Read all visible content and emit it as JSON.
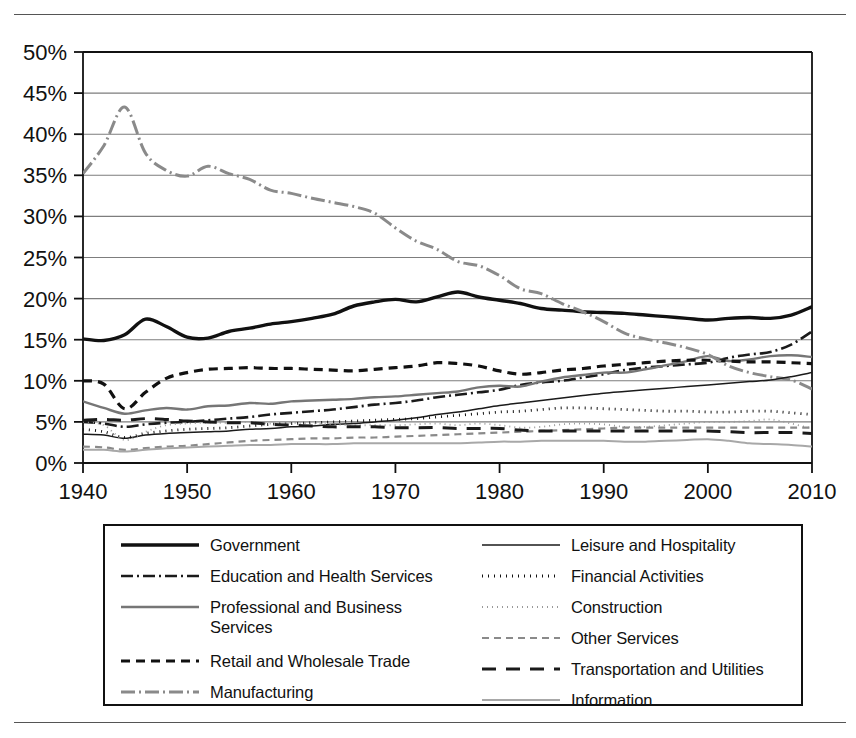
{
  "figure": {
    "kind": "line-chart",
    "has_top_rule": true,
    "has_bottom_rule": true
  },
  "chart_data": {
    "type": "line",
    "title": "",
    "subtitle": "",
    "xlabel": "",
    "ylabel": "",
    "xlim": [
      1940,
      2010
    ],
    "ylim": [
      0,
      50
    ],
    "grid": "horizontal",
    "legend_position": "below",
    "y_ticks": [
      "0%",
      "5%",
      "10%",
      "15%",
      "20%",
      "25%",
      "30%",
      "35%",
      "40%",
      "45%",
      "50%"
    ],
    "y_tick_values": [
      0,
      5,
      10,
      15,
      20,
      25,
      30,
      35,
      40,
      45,
      50
    ],
    "x_ticks": [
      "1940",
      "1950",
      "1960",
      "1970",
      "1980",
      "1990",
      "2000",
      "2010"
    ],
    "x_tick_values": [
      1940,
      1950,
      1960,
      1970,
      1980,
      1990,
      2000,
      2010
    ],
    "x": [
      1940,
      1942,
      1944,
      1946,
      1948,
      1950,
      1952,
      1954,
      1956,
      1958,
      1960,
      1962,
      1964,
      1966,
      1968,
      1970,
      1972,
      1974,
      1976,
      1978,
      1980,
      1982,
      1984,
      1986,
      1988,
      1990,
      1992,
      1994,
      1996,
      1998,
      2000,
      2002,
      2004,
      2006,
      2008,
      2010
    ],
    "series": [
      {
        "name": "Government",
        "style": "solid-thick",
        "color": "#111111",
        "width": 3.4,
        "dash": "",
        "values": [
          15.1,
          14.9,
          15.6,
          17.5,
          16.6,
          15.3,
          15.2,
          16.0,
          16.4,
          16.9,
          17.2,
          17.6,
          18.1,
          19.1,
          19.6,
          19.9,
          19.6,
          20.2,
          20.8,
          20.2,
          19.8,
          19.4,
          18.8,
          18.6,
          18.4,
          18.3,
          18.2,
          18.0,
          17.8,
          17.6,
          17.4,
          17.6,
          17.7,
          17.6,
          18.0,
          19.0
        ]
      },
      {
        "name": "Education and Health Services",
        "style": "dash-dot",
        "color": "#1a1a1a",
        "width": 2.6,
        "dash": "12,4,2,4",
        "values": [
          5.0,
          4.8,
          4.4,
          4.7,
          4.9,
          5.0,
          5.2,
          5.4,
          5.6,
          5.9,
          6.1,
          6.3,
          6.5,
          6.8,
          7.1,
          7.3,
          7.6,
          8.0,
          8.3,
          8.6,
          8.9,
          9.5,
          9.8,
          10.0,
          10.4,
          10.8,
          11.3,
          11.6,
          11.8,
          12.0,
          12.2,
          12.8,
          13.2,
          13.5,
          14.4,
          16.0
        ]
      },
      {
        "name": "Professional and Business\nServices",
        "style": "solid-gray",
        "color": "#767676",
        "width": 2.4,
        "dash": "",
        "values": [
          7.5,
          6.7,
          6.0,
          6.4,
          6.7,
          6.5,
          6.9,
          7.0,
          7.3,
          7.2,
          7.5,
          7.6,
          7.7,
          7.8,
          8.0,
          8.1,
          8.3,
          8.5,
          8.7,
          9.2,
          9.4,
          9.3,
          9.9,
          10.4,
          10.7,
          11.0,
          11.0,
          11.4,
          11.9,
          12.4,
          13.0,
          12.4,
          12.6,
          13.0,
          13.1,
          12.9
        ]
      },
      {
        "name": "Retail and Wholesale Trade",
        "style": "dashed-thick",
        "color": "#111111",
        "width": 3.2,
        "dash": "9,6",
        "values": [
          10.0,
          9.6,
          6.6,
          8.6,
          10.3,
          11.0,
          11.4,
          11.5,
          11.6,
          11.5,
          11.5,
          11.4,
          11.3,
          11.2,
          11.4,
          11.6,
          11.8,
          12.2,
          12.1,
          11.8,
          11.2,
          10.8,
          11.0,
          11.3,
          11.5,
          11.8,
          12.0,
          12.2,
          12.4,
          12.5,
          12.5,
          12.4,
          12.3,
          12.3,
          12.2,
          12.1
        ]
      },
      {
        "name": "Manufacturing",
        "style": "dash-dot-gray",
        "color": "#8a8a8a",
        "width": 3.0,
        "dash": "14,4,2,4",
        "values": [
          35.2,
          38.6,
          43.3,
          37.7,
          35.6,
          34.9,
          36.1,
          35.2,
          34.5,
          33.2,
          32.8,
          32.2,
          31.7,
          31.2,
          30.4,
          28.6,
          27.0,
          26.0,
          24.5,
          24.0,
          22.8,
          21.2,
          20.6,
          19.4,
          18.4,
          17.2,
          15.8,
          15.1,
          14.6,
          14.0,
          13.2,
          11.8,
          11.0,
          10.5,
          10.1,
          9.0
        ]
      },
      {
        "name": "Leisure and Hospitality",
        "style": "solid-thin",
        "color": "#1a1a1a",
        "width": 1.5,
        "dash": "",
        "values": [
          3.5,
          3.4,
          3.0,
          3.4,
          3.6,
          3.7,
          3.8,
          3.9,
          4.1,
          4.2,
          4.4,
          4.5,
          4.7,
          4.8,
          5.0,
          5.2,
          5.5,
          5.9,
          6.2,
          6.6,
          7.0,
          7.3,
          7.6,
          7.9,
          8.2,
          8.5,
          8.7,
          8.9,
          9.1,
          9.3,
          9.5,
          9.7,
          9.9,
          10.1,
          10.5,
          11.0
        ]
      },
      {
        "name": "Financial Activities",
        "style": "dotted-bold",
        "color": "#111111",
        "width": 2.8,
        "dash": "1,5",
        "values": [
          4.1,
          3.8,
          3.1,
          3.6,
          3.9,
          4.1,
          4.2,
          4.3,
          4.5,
          4.7,
          4.8,
          4.9,
          5.0,
          5.1,
          5.2,
          5.3,
          5.4,
          5.6,
          5.8,
          6.0,
          6.2,
          6.3,
          6.5,
          6.7,
          6.7,
          6.6,
          6.5,
          6.4,
          6.3,
          6.3,
          6.2,
          6.2,
          6.3,
          6.3,
          6.1,
          5.9
        ]
      },
      {
        "name": "Construction",
        "style": "dotted-fine",
        "color": "#9a9a9a",
        "width": 1.8,
        "dash": "1,4",
        "values": [
          5.0,
          4.6,
          2.8,
          3.8,
          4.6,
          4.8,
          4.9,
          4.9,
          5.0,
          4.8,
          4.9,
          4.8,
          4.7,
          4.6,
          4.6,
          4.6,
          4.7,
          4.8,
          4.6,
          4.8,
          4.6,
          4.3,
          4.4,
          4.7,
          4.8,
          4.7,
          4.4,
          4.4,
          4.6,
          4.8,
          5.0,
          5.0,
          5.1,
          5.3,
          4.8,
          4.2
        ]
      },
      {
        "name": "Other Services",
        "style": "dashed-gray",
        "color": "#8a8a8a",
        "width": 2.2,
        "dash": "7,5",
        "values": [
          2.0,
          1.9,
          1.6,
          1.8,
          2.0,
          2.1,
          2.3,
          2.5,
          2.7,
          2.8,
          2.9,
          3.0,
          3.0,
          3.1,
          3.1,
          3.2,
          3.3,
          3.4,
          3.5,
          3.6,
          3.7,
          3.8,
          3.9,
          4.0,
          4.1,
          4.2,
          4.3,
          4.3,
          4.3,
          4.3,
          4.3,
          4.3,
          4.3,
          4.3,
          4.3,
          4.3
        ]
      },
      {
        "name": "Transportation and Utilities",
        "style": "dashed-long",
        "color": "#1a1a1a",
        "width": 3.0,
        "dash": "14,10",
        "values": [
          5.2,
          5.3,
          5.2,
          5.4,
          5.3,
          5.1,
          5.0,
          4.9,
          4.9,
          4.7,
          4.6,
          4.5,
          4.4,
          4.4,
          4.4,
          4.3,
          4.3,
          4.3,
          4.2,
          4.2,
          4.2,
          4.0,
          3.9,
          3.9,
          3.9,
          3.9,
          3.9,
          3.9,
          3.9,
          3.9,
          3.9,
          3.8,
          3.7,
          3.7,
          3.7,
          3.6
        ]
      },
      {
        "name": "Information",
        "style": "solid-lightgray",
        "color": "#a8a8a8",
        "width": 2.0,
        "dash": "",
        "values": [
          1.6,
          1.6,
          1.4,
          1.6,
          1.8,
          1.9,
          2.0,
          2.1,
          2.2,
          2.2,
          2.3,
          2.3,
          2.3,
          2.4,
          2.4,
          2.4,
          2.4,
          2.4,
          2.4,
          2.5,
          2.6,
          2.6,
          2.7,
          2.7,
          2.7,
          2.7,
          2.6,
          2.6,
          2.7,
          2.8,
          2.9,
          2.7,
          2.4,
          2.3,
          2.2,
          2.0
        ]
      }
    ]
  },
  "legend": {
    "columns": [
      {
        "items": [
          {
            "label": "Government",
            "series": "Government"
          },
          {
            "label": "Education and Health Services",
            "series": "Education and Health Services"
          },
          {
            "label": "Professional and Business\nServices",
            "series": "Professional and Business\nServices"
          },
          {
            "label": "Retail and Wholesale Trade",
            "series": "Retail and Wholesale Trade"
          },
          {
            "label": "Manufacturing",
            "series": "Manufacturing"
          }
        ]
      },
      {
        "items": [
          {
            "label": "Leisure and Hospitality",
            "series": "Leisure and Hospitality"
          },
          {
            "label": "Financial Activities",
            "series": "Financial Activities"
          },
          {
            "label": "Construction",
            "series": "Construction"
          },
          {
            "label": "Other Services",
            "series": "Other Services"
          },
          {
            "label": "Transportation and Utilities",
            "series": "Transportation and Utilities"
          },
          {
            "label": "Information",
            "series": "Information"
          }
        ]
      }
    ]
  }
}
